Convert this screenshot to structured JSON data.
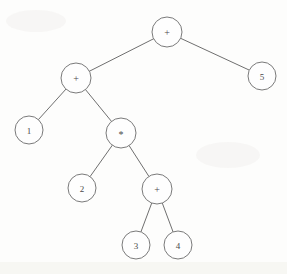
{
  "figure": {
    "background_color": "#fdfdfc",
    "line_color": "#6f6f6f",
    "node_stroke_color": "#7a7a7a",
    "node_fill_color": "#fefefe",
    "label_color": "#4a4a4a",
    "width": 287,
    "height": 274
  },
  "chart_data": {
    "type": "diagram",
    "diagram_kind": "binary-expression-tree",
    "title": "",
    "expression": "1 + 2 * (3 + 4) + 5",
    "nodes": [
      {
        "id": "n0",
        "label": "+",
        "kind": "operator",
        "cx": 167,
        "cy": 32,
        "r": 15,
        "depth": 0
      },
      {
        "id": "n1",
        "label": "+",
        "kind": "operator",
        "cx": 76,
        "cy": 78,
        "r": 15,
        "depth": 1
      },
      {
        "id": "n2",
        "label": "5",
        "kind": "operand",
        "cx": 262,
        "cy": 76,
        "r": 14,
        "depth": 1
      },
      {
        "id": "n3",
        "label": "1",
        "kind": "operand",
        "cx": 29,
        "cy": 130,
        "r": 14,
        "depth": 2
      },
      {
        "id": "n4",
        "label": "*",
        "kind": "operator",
        "cx": 121,
        "cy": 133,
        "r": 15,
        "depth": 2
      },
      {
        "id": "n5",
        "label": "2",
        "kind": "operand",
        "cx": 82,
        "cy": 188,
        "r": 14,
        "depth": 3
      },
      {
        "id": "n6",
        "label": "+",
        "kind": "operator",
        "cx": 157,
        "cy": 189,
        "r": 15,
        "depth": 3
      },
      {
        "id": "n7",
        "label": "3",
        "kind": "operand",
        "cx": 136,
        "cy": 245,
        "r": 14,
        "depth": 4
      },
      {
        "id": "n8",
        "label": "4",
        "kind": "operand",
        "cx": 178,
        "cy": 245,
        "r": 14,
        "depth": 4
      }
    ],
    "edges": [
      {
        "from": "n0",
        "to": "n1",
        "side": "left"
      },
      {
        "from": "n0",
        "to": "n2",
        "side": "right"
      },
      {
        "from": "n1",
        "to": "n3",
        "side": "left"
      },
      {
        "from": "n1",
        "to": "n4",
        "side": "right"
      },
      {
        "from": "n4",
        "to": "n5",
        "side": "left"
      },
      {
        "from": "n4",
        "to": "n6",
        "side": "right"
      },
      {
        "from": "n6",
        "to": "n7",
        "side": "left"
      },
      {
        "from": "n6",
        "to": "n8",
        "side": "right"
      }
    ]
  }
}
